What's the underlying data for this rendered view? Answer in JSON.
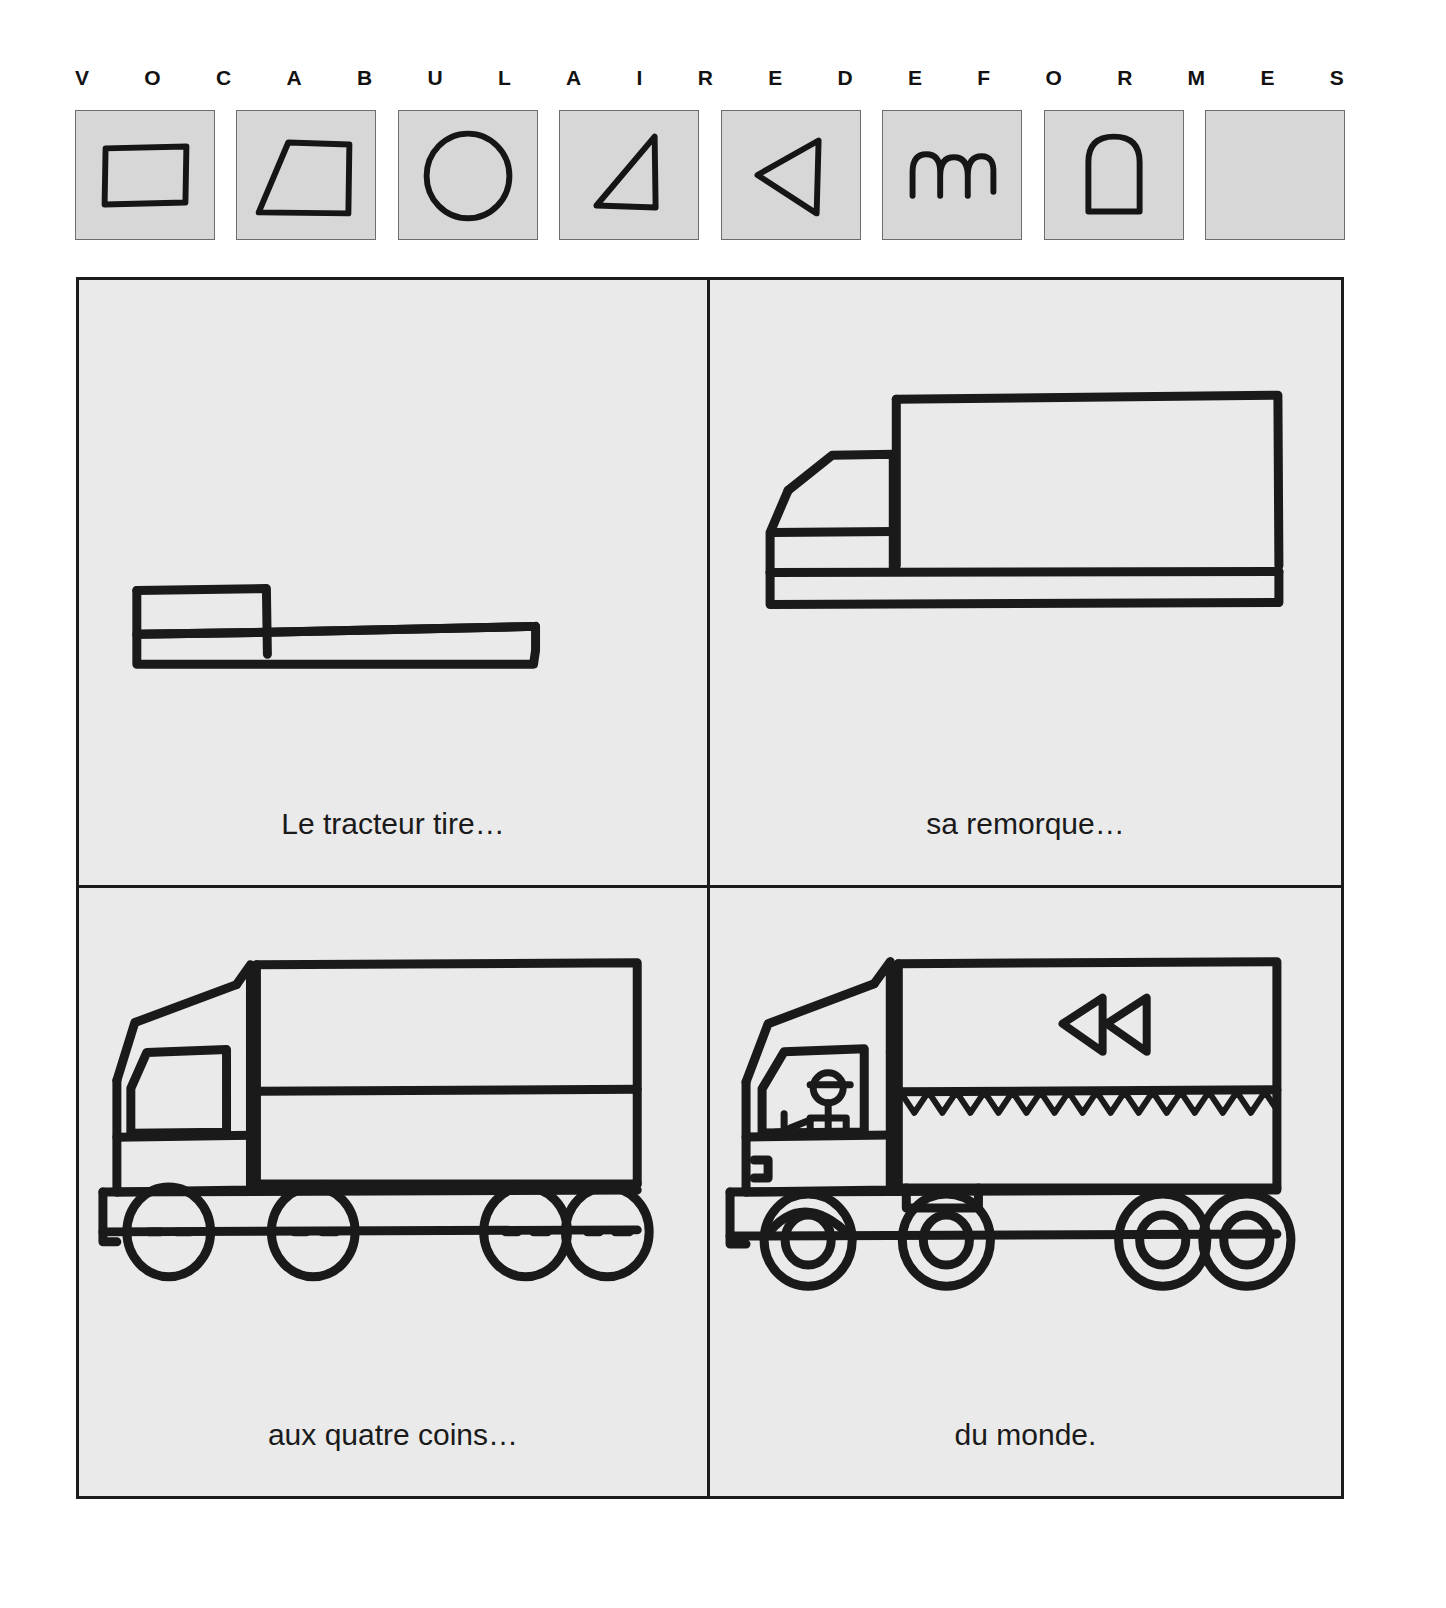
{
  "header": {
    "letters": [
      "V",
      "O",
      "C",
      "A",
      "B",
      "U",
      "L",
      "A",
      "I",
      "R",
      "E",
      "D",
      "E",
      "F",
      "O",
      "R",
      "M",
      "E",
      "S"
    ],
    "swatches": [
      {
        "name": "rectangle",
        "label": "rectangle"
      },
      {
        "name": "trapezoid",
        "label": "trapeze"
      },
      {
        "name": "circle",
        "label": "cercle"
      },
      {
        "name": "right-triangle",
        "label": "triangle rectangle"
      },
      {
        "name": "left-triangle",
        "label": "triangle pointe a gauche"
      },
      {
        "name": "arches",
        "label": "arcs"
      },
      {
        "name": "arch-shape",
        "label": "arche"
      },
      {
        "name": "empty",
        "label": "vide"
      }
    ]
  },
  "comic": {
    "panels": [
      {
        "id": "panel-1",
        "caption": "Le tracteur tire…",
        "art_name": "tractor-chassis-drawing"
      },
      {
        "id": "panel-2",
        "caption": "sa remorque…",
        "art_name": "tractor-with-trailer-drawing"
      },
      {
        "id": "panel-3",
        "caption": "aux quatre coins…",
        "art_name": "truck-with-wheels-drawing"
      },
      {
        "id": "panel-4",
        "caption": "du monde.",
        "art_name": "finished-truck-with-driver-drawing"
      }
    ]
  },
  "colors": {
    "page_background": "#ffffff",
    "panel_background": "#eaeaea",
    "swatch_fill": "#d7d7d7",
    "ink": "#1c1c1c"
  }
}
